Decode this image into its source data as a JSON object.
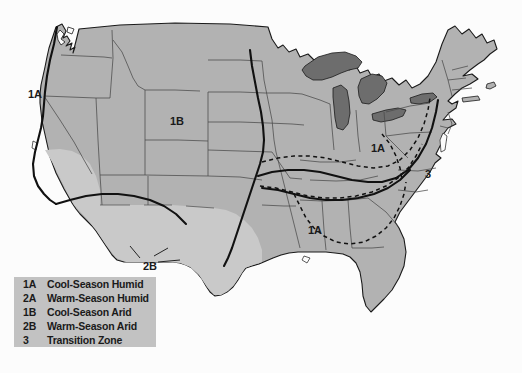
{
  "figure": {
    "type": "thematic-map",
    "background_color": "#fcfcfc"
  },
  "colors": {
    "land_fill": "#b2b2b2",
    "arid_fill": "#c9c9c9",
    "great_lakes_fill": "#6d6d6d",
    "outline": "#1a1a1a",
    "state_border": "#4a4a4a",
    "legend_background": "#c2c2c2",
    "label_text": "#1a1a1a"
  },
  "map_labels": [
    {
      "text": "1A",
      "x": 28,
      "y": 88,
      "region": "pacific-northwest-coast"
    },
    {
      "text": "1B",
      "x": 170,
      "y": 115,
      "region": "intermountain-west"
    },
    {
      "text": "1A",
      "x": 371,
      "y": 142,
      "region": "ohio-valley"
    },
    {
      "text": "3",
      "x": 425,
      "y": 168,
      "region": "mid-atlantic-transition"
    },
    {
      "text": "1A",
      "x": 308,
      "y": 224,
      "region": "mid-south"
    },
    {
      "text": "2B",
      "x": 143,
      "y": 260,
      "region": "southern-plains"
    }
  ],
  "legend": {
    "rows": [
      {
        "code": "1A",
        "label": "Cool-Season Humid"
      },
      {
        "code": "2A",
        "label": "Warm-Season Humid"
      },
      {
        "code": "1B",
        "label": "Cool-Season Arid"
      },
      {
        "code": "2B",
        "label": "Warm-Season Arid"
      },
      {
        "code": "3",
        "label": "Transition Zone"
      }
    ]
  }
}
